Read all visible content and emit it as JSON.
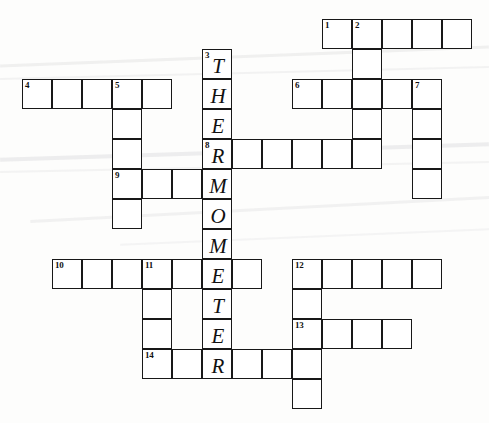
{
  "puzzle": {
    "title": "Thermometer Crossword Grid",
    "theme_word": "THERMOMETER",
    "cell_size": 30,
    "origin_x": 22,
    "origin_y": 19,
    "columns": 15,
    "rows": 13,
    "background_color": "#fdfdfc",
    "line_color": "#181818",
    "cell_fill": "#ffffff",
    "streak_color": "#e9e9ea"
  },
  "entries": [
    {
      "number": "1",
      "direction": "across",
      "row": 0,
      "col": 10,
      "length": 5
    },
    {
      "number": "2",
      "direction": "down",
      "row": 0,
      "col": 11,
      "length": 6
    },
    {
      "number": "3",
      "direction": "down",
      "row": 1,
      "col": 6,
      "length": 11
    },
    {
      "number": "4",
      "direction": "across",
      "row": 2,
      "col": 0,
      "length": 5
    },
    {
      "number": "5",
      "direction": "down",
      "row": 2,
      "col": 3,
      "length": 5
    },
    {
      "number": "6",
      "direction": "across",
      "row": 2,
      "col": 9,
      "length": 5
    },
    {
      "number": "7",
      "direction": "down",
      "row": 2,
      "col": 13,
      "length": 4
    },
    {
      "number": "8",
      "direction": "across",
      "row": 4,
      "col": 6,
      "length": 6
    },
    {
      "number": "9",
      "direction": "across",
      "row": 5,
      "col": 3,
      "length": 4
    },
    {
      "number": "10",
      "direction": "across",
      "row": 8,
      "col": 1,
      "length": 8
    },
    {
      "number": "11",
      "direction": "down",
      "row": 8,
      "col": 4,
      "length": 4
    },
    {
      "number": "12",
      "direction": "across",
      "row": 8,
      "col": 9,
      "length": 5
    },
    {
      "number": "12b",
      "direction": "down",
      "row": 8,
      "col": 9,
      "length": 5
    },
    {
      "number": "13",
      "direction": "across",
      "row": 10,
      "col": 9,
      "length": 4
    },
    {
      "number": "14",
      "direction": "across",
      "row": 11,
      "col": 4,
      "length": 6
    }
  ],
  "cells": [
    {
      "row": 0,
      "col": 10,
      "num": "1",
      "letter": ""
    },
    {
      "row": 0,
      "col": 11,
      "num": "2",
      "letter": ""
    },
    {
      "row": 0,
      "col": 12,
      "num": "",
      "letter": ""
    },
    {
      "row": 0,
      "col": 13,
      "num": "",
      "letter": ""
    },
    {
      "row": 0,
      "col": 14,
      "num": "",
      "letter": ""
    },
    {
      "row": 1,
      "col": 6,
      "num": "3",
      "letter": "T"
    },
    {
      "row": 1,
      "col": 11,
      "num": "",
      "letter": ""
    },
    {
      "row": 2,
      "col": 0,
      "num": "4",
      "letter": ""
    },
    {
      "row": 2,
      "col": 1,
      "num": "",
      "letter": ""
    },
    {
      "row": 2,
      "col": 2,
      "num": "",
      "letter": ""
    },
    {
      "row": 2,
      "col": 3,
      "num": "5",
      "letter": ""
    },
    {
      "row": 2,
      "col": 4,
      "num": "",
      "letter": ""
    },
    {
      "row": 2,
      "col": 6,
      "num": "",
      "letter": "H"
    },
    {
      "row": 2,
      "col": 9,
      "num": "6",
      "letter": ""
    },
    {
      "row": 2,
      "col": 10,
      "num": "",
      "letter": ""
    },
    {
      "row": 2,
      "col": 11,
      "num": "",
      "letter": ""
    },
    {
      "row": 2,
      "col": 12,
      "num": "",
      "letter": ""
    },
    {
      "row": 2,
      "col": 13,
      "num": "7",
      "letter": ""
    },
    {
      "row": 3,
      "col": 3,
      "num": "",
      "letter": ""
    },
    {
      "row": 3,
      "col": 6,
      "num": "",
      "letter": "E"
    },
    {
      "row": 3,
      "col": 11,
      "num": "",
      "letter": ""
    },
    {
      "row": 3,
      "col": 13,
      "num": "",
      "letter": ""
    },
    {
      "row": 4,
      "col": 3,
      "num": "",
      "letter": ""
    },
    {
      "row": 4,
      "col": 6,
      "num": "8",
      "letter": "R"
    },
    {
      "row": 4,
      "col": 7,
      "num": "",
      "letter": ""
    },
    {
      "row": 4,
      "col": 8,
      "num": "",
      "letter": ""
    },
    {
      "row": 4,
      "col": 9,
      "num": "",
      "letter": ""
    },
    {
      "row": 4,
      "col": 10,
      "num": "",
      "letter": ""
    },
    {
      "row": 4,
      "col": 11,
      "num": "",
      "letter": ""
    },
    {
      "row": 4,
      "col": 13,
      "num": "",
      "letter": ""
    },
    {
      "row": 5,
      "col": 3,
      "num": "9",
      "letter": ""
    },
    {
      "row": 5,
      "col": 4,
      "num": "",
      "letter": ""
    },
    {
      "row": 5,
      "col": 5,
      "num": "",
      "letter": ""
    },
    {
      "row": 5,
      "col": 6,
      "num": "",
      "letter": "M"
    },
    {
      "row": 5,
      "col": 13,
      "num": "",
      "letter": ""
    },
    {
      "row": 6,
      "col": 3,
      "num": "",
      "letter": ""
    },
    {
      "row": 6,
      "col": 6,
      "num": "",
      "letter": "O"
    },
    {
      "row": 7,
      "col": 6,
      "num": "",
      "letter": "M"
    },
    {
      "row": 8,
      "col": 1,
      "num": "10",
      "letter": ""
    },
    {
      "row": 8,
      "col": 2,
      "num": "",
      "letter": ""
    },
    {
      "row": 8,
      "col": 3,
      "num": "",
      "letter": ""
    },
    {
      "row": 8,
      "col": 4,
      "num": "11",
      "letter": ""
    },
    {
      "row": 8,
      "col": 5,
      "num": "",
      "letter": ""
    },
    {
      "row": 8,
      "col": 6,
      "num": "",
      "letter": "E"
    },
    {
      "row": 8,
      "col": 7,
      "num": "",
      "letter": ""
    },
    {
      "row": 8,
      "col": 9,
      "num": "12",
      "letter": ""
    },
    {
      "row": 8,
      "col": 10,
      "num": "",
      "letter": ""
    },
    {
      "row": 8,
      "col": 11,
      "num": "",
      "letter": ""
    },
    {
      "row": 8,
      "col": 12,
      "num": "",
      "letter": ""
    },
    {
      "row": 8,
      "col": 13,
      "num": "",
      "letter": ""
    },
    {
      "row": 9,
      "col": 4,
      "num": "",
      "letter": ""
    },
    {
      "row": 9,
      "col": 6,
      "num": "",
      "letter": "T"
    },
    {
      "row": 9,
      "col": 9,
      "num": "",
      "letter": ""
    },
    {
      "row": 10,
      "col": 4,
      "num": "",
      "letter": ""
    },
    {
      "row": 10,
      "col": 6,
      "num": "",
      "letter": "E"
    },
    {
      "row": 10,
      "col": 9,
      "num": "13",
      "letter": ""
    },
    {
      "row": 10,
      "col": 10,
      "num": "",
      "letter": ""
    },
    {
      "row": 10,
      "col": 11,
      "num": "",
      "letter": ""
    },
    {
      "row": 10,
      "col": 12,
      "num": "",
      "letter": ""
    },
    {
      "row": 11,
      "col": 4,
      "num": "14",
      "letter": ""
    },
    {
      "row": 11,
      "col": 5,
      "num": "",
      "letter": ""
    },
    {
      "row": 11,
      "col": 6,
      "num": "",
      "letter": "R"
    },
    {
      "row": 11,
      "col": 7,
      "num": "",
      "letter": ""
    },
    {
      "row": 11,
      "col": 8,
      "num": "",
      "letter": ""
    },
    {
      "row": 11,
      "col": 9,
      "num": "",
      "letter": ""
    },
    {
      "row": 12,
      "col": 9,
      "num": "",
      "letter": ""
    }
  ],
  "streaks": [
    {
      "x": 0,
      "y": 55,
      "width": 489,
      "height": 3,
      "rotate": -2.2,
      "opacity": 0.7
    },
    {
      "x": 0,
      "y": 72,
      "width": 489,
      "height": 2,
      "rotate": -1.4,
      "opacity": 0.55
    },
    {
      "x": 0,
      "y": 150,
      "width": 489,
      "height": 4,
      "rotate": -1.8,
      "opacity": 0.8
    },
    {
      "x": 0,
      "y": 166,
      "width": 489,
      "height": 2,
      "rotate": -1.2,
      "opacity": 0.5
    },
    {
      "x": 30,
      "y": 208,
      "width": 460,
      "height": 3,
      "rotate": -3.0,
      "opacity": 0.6
    },
    {
      "x": 120,
      "y": 236,
      "width": 370,
      "height": 2,
      "rotate": -2.4,
      "opacity": 0.45
    }
  ]
}
